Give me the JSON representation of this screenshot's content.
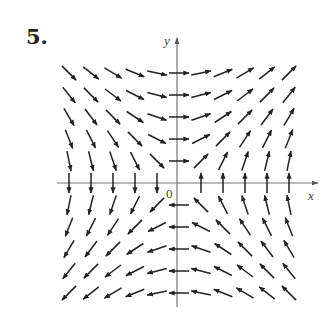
{
  "figure": {
    "problem_number": "5.",
    "x_axis_label": "x",
    "y_axis_label": "y",
    "origin_label": "0",
    "axis_color": "#777777",
    "arrow_color": "#222222"
  },
  "chart_data": {
    "type": "vector_field",
    "title": "5.",
    "xlabel": "x",
    "ylabel": "y",
    "field": "F(x, y) = (y, x), arrows normalized to equal length",
    "grid": {
      "x_values": [
        -5,
        -4,
        -3,
        -2,
        -1,
        0,
        1,
        2,
        3,
        4,
        5
      ],
      "y_values": [
        -5,
        -4,
        -3,
        -2,
        -1,
        0,
        1,
        2,
        3,
        4,
        5
      ]
    },
    "origin_px": [
      177,
      183
    ],
    "spacing_px": 22,
    "arrow_length_px": 20,
    "quadrant_directions": {
      "upper_left": "down-right",
      "upper_right": "up-right",
      "lower_left": "down-left",
      "lower_right": "up-left",
      "positive_y_axis": "right",
      "negative_y_axis": "left",
      "positive_x_axis": "up",
      "negative_x_axis": "down",
      "origin": "zero vector (no arrow)"
    }
  }
}
